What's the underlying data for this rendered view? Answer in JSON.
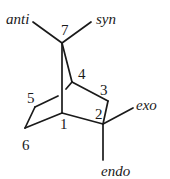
{
  "diagram": {
    "atom_labels": {
      "c1": "1",
      "c2": "2",
      "c3": "3",
      "c4": "4",
      "c5": "5",
      "c6": "6",
      "c7": "7"
    },
    "substituent_labels": {
      "anti": "anti",
      "syn": "syn",
      "exo": "exo",
      "endo": "endo"
    },
    "line_color": "#1a1a1a",
    "background": "#ffffff"
  }
}
